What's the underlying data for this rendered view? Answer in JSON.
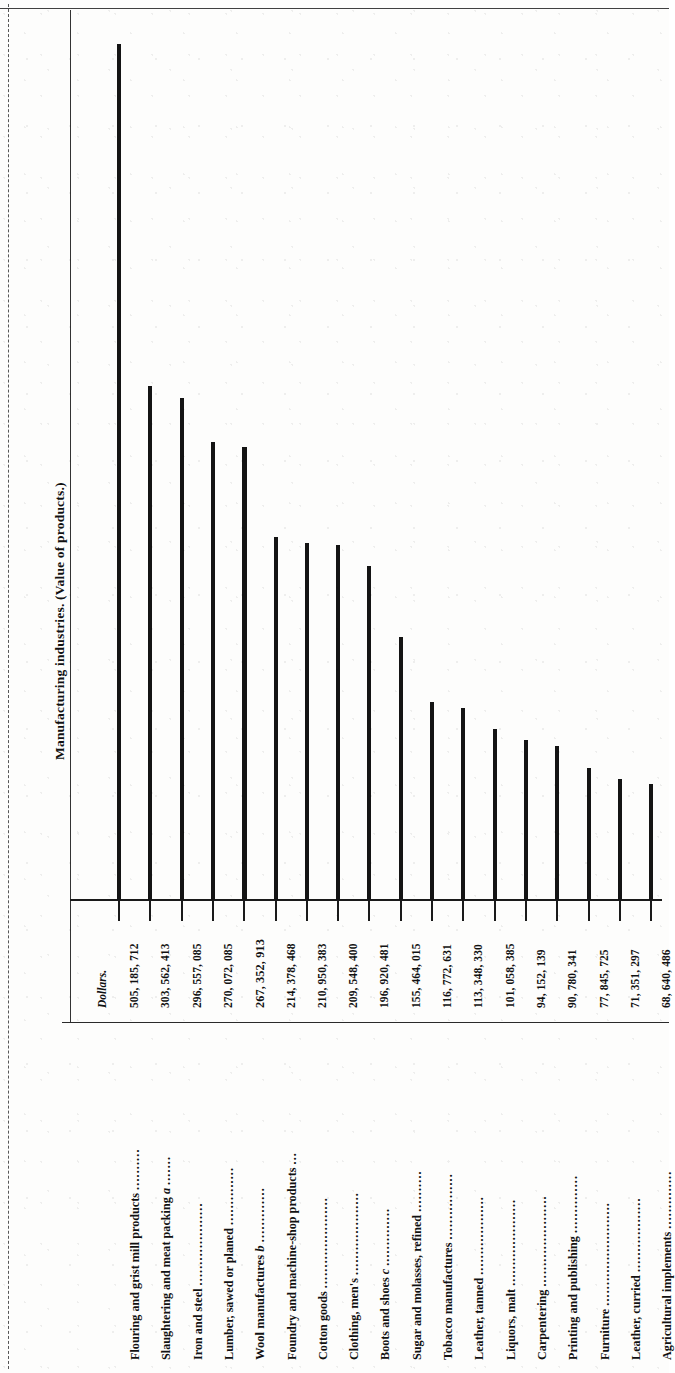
{
  "page": {
    "title": "Manufacturing industries.  (Value of products.)",
    "dollars_header": "Dollars.",
    "orientation": "rotated-90"
  },
  "chart_data": {
    "type": "bar",
    "title": "Manufacturing industries.  (Value of products.)",
    "xlabel": "",
    "ylabel": "Dollars.",
    "orientation": "vertical-bars-on-rotated-page",
    "grid": false,
    "legend": null,
    "ylim": [
      0,
      505185712
    ],
    "categories": [
      "Flouring and grist mill products",
      "Slaughtering and meat packing a",
      "Iron and steel",
      "Lumber, sawed or planed",
      "Wool manufactures b",
      "Foundry and machine-shop products",
      "Cotton goods",
      "Clothing, men's",
      "Boots and shoes c",
      "Sugar and molasses, refined",
      "Tobacco manufactures",
      "Leather, tanned",
      "Liquors, malt",
      "Carpentering",
      "Printing and publishing",
      "Furniture",
      "Leather, curried",
      "Agricultural implements"
    ],
    "values": [
      505185712,
      303562413,
      296557085,
      270072085,
      267352913,
      214378468,
      210950383,
      209548400,
      196920481,
      155464015,
      116772631,
      113348330,
      101058385,
      94152139,
      90780341,
      77845725,
      71351297,
      68640486
    ],
    "value_labels": [
      "505, 185, 712",
      "303, 562, 413",
      "296, 557, 085",
      "270, 072, 085",
      "267, 352, 913",
      "214, 378, 468",
      "210, 950, 383",
      "209, 548, 400",
      "196, 920, 481",
      "155, 464, 015",
      "116, 772, 631",
      "113, 348, 330",
      "101, 058, 385",
      "94, 152, 139",
      "90, 780, 341",
      "77, 845, 725",
      "71, 351, 297",
      "68, 640, 486"
    ],
    "highlighted_index": 4,
    "highlighted_note": "Wool manufactures b row is set in bold type"
  },
  "rows": [
    {
      "label": "Flouring and grist mill products",
      "leader": "..........",
      "value": "505, 185, 712",
      "bold": false
    },
    {
      "label": "Slaughtering and meat packing",
      "footnote": "a",
      "leader": ".......",
      "value": "303, 562, 413",
      "bold": false
    },
    {
      "label": "Iron and steel",
      "leader": "....................",
      "value": "296, 557, 085",
      "bold": false
    },
    {
      "label": "Lumber, sawed or planed",
      "leader": "..............",
      "value": "270, 072, 085",
      "bold": false
    },
    {
      "label": "Wool manufactures",
      "footnote": "b",
      "leader": ".............",
      "value": "267, 352, 913",
      "bold": true
    },
    {
      "label": "Foundry and machine-shop products",
      "leader": "...",
      "value": "214, 378, 468",
      "bold": false
    },
    {
      "label": "Cotton goods",
      "leader": "......................",
      "value": "210, 950, 383",
      "bold": false
    },
    {
      "label": "Clothing, men's",
      "leader": "....................",
      "value": "209, 548, 400",
      "bold": false
    },
    {
      "label": "Boots and shoes",
      "footnote": "c",
      "leader": "..............",
      "value": "196, 920, 481",
      "bold": false
    },
    {
      "label": "Sugar and molasses, refined",
      "leader": "..........",
      "value": "155, 464, 015",
      "bold": false
    },
    {
      "label": "Tobacco manufactures",
      "leader": "................",
      "value": "116, 772, 631",
      "bold": false
    },
    {
      "label": "Leather, tanned",
      "leader": "...................",
      "value": "113, 348, 330",
      "bold": false
    },
    {
      "label": "Liquors, malt",
      "leader": ".....................",
      "value": "101, 058, 385",
      "bold": false
    },
    {
      "label": "Carpentering",
      "leader": "......................",
      "value": "94, 152, 139",
      "bold": false
    },
    {
      "label": "Printing and publishing",
      "leader": "..............",
      "value": "90, 780, 341",
      "bold": false
    },
    {
      "label": "Furniture",
      "leader": ".........................",
      "value": "77, 845, 725",
      "bold": false
    },
    {
      "label": "Leather, curried",
      "leader": "..................",
      "value": "71, 351, 297",
      "bold": false
    },
    {
      "label": "Agricultural implements",
      "leader": "..............",
      "value": "68, 640, 486",
      "bold": false
    }
  ]
}
